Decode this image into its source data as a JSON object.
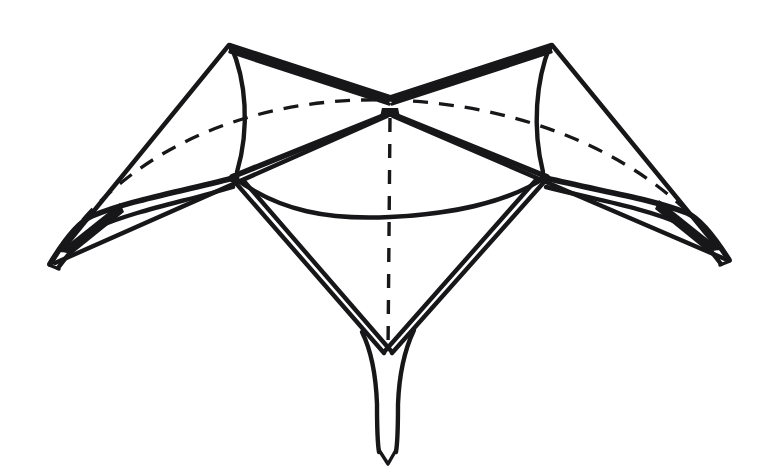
{
  "figure": {
    "description": "Hand-inked geometric diagram of a star-shaped ruled surface with two upper peaks, two lateral spikes and one lower spike, a dashed hidden ellipse and a solid visible arc",
    "style": "black ink line art on white paper",
    "canvas": {
      "width": 779,
      "height": 476
    },
    "colors": {
      "ink": "#17171a",
      "paper": "#ffffff"
    },
    "line_weights": {
      "heavy": 7.2,
      "bold": 5.6,
      "medium": 4.4,
      "thin": 3.4,
      "fine": 2.8,
      "hidden_dash": 3.3
    },
    "points": {
      "peak_left": {
        "x": 230,
        "y": 44
      },
      "peak_right": {
        "x": 551,
        "y": 44
      },
      "notch_top": {
        "x": 390,
        "y": 97
      },
      "center": {
        "x": 390,
        "y": 113
      },
      "vertex_left": {
        "x": 233,
        "y": 177
      },
      "vertex_right": {
        "x": 546,
        "y": 177
      },
      "tip_left": {
        "x": 48,
        "y": 266
      },
      "tip_left_knee": {
        "x": 88,
        "y": 221
      },
      "tip_right": {
        "x": 731,
        "y": 262
      },
      "tip_right_knee": {
        "x": 691,
        "y": 218
      },
      "notch_bottom": {
        "x": 388,
        "y": 355
      },
      "tip_bottom": {
        "x": 388,
        "y": 452
      },
      "arc_front_sag": {
        "x": 390,
        "y": 216
      },
      "ellipse_back_top": {
        "x": 390,
        "y": 100
      }
    },
    "elements": [
      {
        "name": "upper-left-ridge",
        "kind": "double-line",
        "from": "peak_left",
        "to": "notch_top"
      },
      {
        "name": "upper-right-ridge",
        "kind": "double-line",
        "from": "peak_right",
        "to": "notch_top"
      },
      {
        "name": "left-outer-edge",
        "kind": "single-line",
        "from": "peak_left",
        "to": "tip_left"
      },
      {
        "name": "right-outer-edge",
        "kind": "single-line",
        "from": "peak_right",
        "to": "tip_right"
      },
      {
        "name": "left-arc",
        "kind": "curve",
        "from": "peak_left",
        "to": "vertex_left"
      },
      {
        "name": "right-arc",
        "kind": "curve",
        "from": "peak_right",
        "to": "vertex_right"
      },
      {
        "name": "center-to-left-vertex",
        "kind": "single-line",
        "from": "center",
        "to": "vertex_left"
      },
      {
        "name": "center-to-right-vertex",
        "kind": "single-line",
        "from": "center",
        "to": "vertex_right"
      },
      {
        "name": "center-to-left-tip",
        "kind": "single-line",
        "from": "center",
        "to": "tip_left"
      },
      {
        "name": "center-to-right-tip",
        "kind": "single-line",
        "from": "center",
        "to": "tip_right"
      },
      {
        "name": "left-spike",
        "kind": "double-line",
        "from": "vertex_left",
        "to": "tip_left"
      },
      {
        "name": "right-spike",
        "kind": "double-line",
        "from": "vertex_right",
        "to": "tip_right"
      },
      {
        "name": "lower-left-edge",
        "kind": "double-line",
        "from": "vertex_left",
        "to": "notch_bottom"
      },
      {
        "name": "lower-right-edge",
        "kind": "double-line",
        "from": "vertex_right",
        "to": "notch_bottom"
      },
      {
        "name": "bottom-spike",
        "kind": "double-line",
        "from": "notch_bottom",
        "to": "tip_bottom"
      },
      {
        "name": "front-arc",
        "kind": "curve",
        "from": "vertex_left",
        "to": "vertex_right",
        "sag": "arc_front_sag"
      },
      {
        "name": "hidden-ellipse-back",
        "kind": "dashed-curve",
        "from": "tip_left",
        "to": "tip_right"
      },
      {
        "name": "hidden-axis",
        "kind": "dashed-line",
        "from": "center",
        "to": "notch_bottom"
      }
    ],
    "counts": {
      "peaks": 2,
      "lateral_spikes": 2,
      "lower_spikes": 1,
      "dashed_curves": 1,
      "dashed_lines": 1,
      "solid_arcs": 3
    }
  }
}
